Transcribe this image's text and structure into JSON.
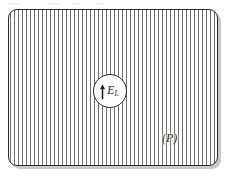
{
  "figure": {
    "type": "physics-schematic",
    "background_color": "#ffffff",
    "region": {
      "name": "hatched-region",
      "shape": "rounded-rectangle",
      "border_color": "#2b2b2b",
      "hatch_color": "#6e6e6e",
      "hatch_direction": "vertical",
      "hatch_spacing_px": 4,
      "corner_radius_px": 9,
      "x": 8,
      "y": 9,
      "width": 210,
      "height": 157
    },
    "callout": {
      "name": "field-callout",
      "shape": "circle",
      "diameter_px": 34,
      "center_x": 110,
      "center_y": 91,
      "fill": "#ffffff",
      "border_color": "#2b2b2b",
      "arrow": {
        "icon": "up-arrow-icon",
        "direction": "up",
        "color": "#1d1d1d"
      },
      "symbol": "E",
      "subscript": "L"
    },
    "plane_label": {
      "name": "plane-label",
      "text": "(P)",
      "style": "italic",
      "color": "#2a2a2a",
      "x": 162,
      "y": 132
    }
  }
}
